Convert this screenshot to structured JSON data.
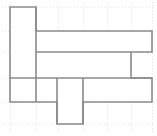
{
  "figure": {
    "kind": "polyomino-net-diagram",
    "canvas": {
      "width": 157,
      "height": 136,
      "background": "#ffffff"
    },
    "grid": {
      "visible": true,
      "style": "dotted",
      "color": "#d8d8d8",
      "dash": "1 2",
      "stroke_width": 0.7,
      "cell_width": 24.4,
      "cell_height": 23.8,
      "x_lines": [
        10,
        36,
        58,
        83,
        107,
        131,
        152
      ],
      "y_lines": [
        7,
        31,
        52,
        78,
        102,
        124
      ]
    },
    "outline": {
      "color": "#8a8a8a",
      "stroke_width": 1.6,
      "fill": "#ffffff",
      "line_join": "miter",
      "points": [
        [
          10,
          7
        ],
        [
          36,
          7
        ],
        [
          36,
          31
        ],
        [
          152,
          31
        ],
        [
          152,
          52
        ],
        [
          131,
          52
        ],
        [
          131,
          78
        ],
        [
          152,
          78
        ],
        [
          152,
          102
        ],
        [
          83,
          102
        ],
        [
          83,
          124
        ],
        [
          57,
          124
        ],
        [
          57,
          102
        ],
        [
          10,
          102
        ]
      ]
    },
    "interior_edges": [
      {
        "name": "edge-top-row-divider",
        "x1": 36,
        "y1": 52,
        "x2": 131,
        "y2": 52
      },
      {
        "name": "edge-bottom-row-divider",
        "x1": 10,
        "y1": 78,
        "x2": 152,
        "y2": 78
      },
      {
        "name": "edge-left-column-divider",
        "x1": 36,
        "y1": 7,
        "x2": 36,
        "y2": 102
      },
      {
        "name": "edge-tab-left-divider",
        "x1": 57,
        "y1": 78,
        "x2": 57,
        "y2": 124
      },
      {
        "name": "edge-tab-right-divider",
        "x1": 83,
        "y1": 78,
        "x2": 83,
        "y2": 124
      }
    ],
    "squares": {
      "count": 14,
      "unit_label": ""
    }
  }
}
